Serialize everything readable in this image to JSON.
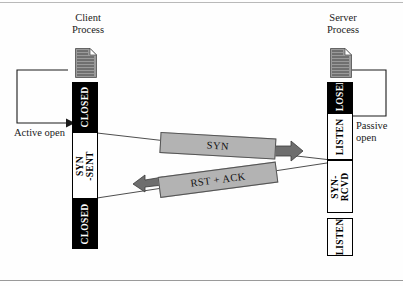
{
  "diagram": {
    "client": {
      "caption_line1": "Client",
      "caption_line2": "Process",
      "icon": "document-icon",
      "open_label_line1": "Active open",
      "open_label_line2": "",
      "states": [
        {
          "label": "CLOSED",
          "style": "dark"
        },
        {
          "label": "SYN\n-SENT",
          "label_line1": "SYN",
          "label_line2": "-SENT",
          "style": "light"
        },
        {
          "label": "CLOSED",
          "style": "dark"
        }
      ]
    },
    "server": {
      "caption_line1": "Server",
      "caption_line2": "Process",
      "icon": "document-icon",
      "open_label_line1": "Passive",
      "open_label_line2": "open",
      "states": [
        {
          "label": "CLOSED",
          "style": "dark"
        },
        {
          "label": "LISTEN",
          "style": "light"
        },
        {
          "label": "SYN-\nRCVD",
          "label_line1": "SYN-",
          "label_line2": "RCVD",
          "style": "light"
        },
        {
          "label": "LISTEN",
          "style": "light"
        }
      ]
    },
    "messages": [
      {
        "label": "SYN",
        "direction": "client-to-server"
      },
      {
        "label": "RST + ACK",
        "direction": "server-to-client"
      }
    ],
    "colors": {
      "banner_fill": "#b3b3b3",
      "banner_stroke": "#555555",
      "state_dark": "#000000",
      "state_light": "#ffffff",
      "line": "#333333",
      "icon_fill": "#9a9a9a",
      "rule": "#b9b9b9"
    }
  }
}
